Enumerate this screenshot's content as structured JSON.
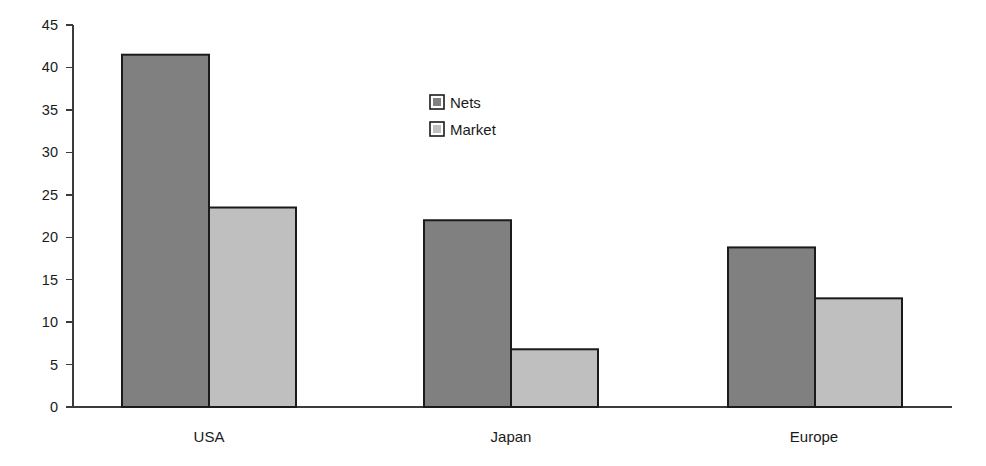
{
  "chart_data": {
    "type": "bar",
    "title": "",
    "subtitle": "",
    "xlabel": "",
    "ylabel": "",
    "categories": [
      "USA",
      "Japan",
      "Europe"
    ],
    "series": [
      {
        "name": "Nets",
        "color": "#808080",
        "values": [
          41.5,
          22.0,
          18.8
        ]
      },
      {
        "name": "Market",
        "color": "#bfbfbf",
        "values": [
          23.5,
          6.8,
          12.8
        ]
      }
    ],
    "ylim": [
      0,
      45
    ],
    "ytick_step": 5,
    "yticks": [
      "0",
      "5",
      "10",
      "15",
      "20",
      "25",
      "30",
      "35",
      "40",
      "45"
    ],
    "grid": false,
    "legend_position": "inside-upper-center",
    "axis_color": "#3b3b3b",
    "bar_border_color": "#1b1b1b",
    "background": "#ffffff"
  },
  "legend": {
    "entries": [
      {
        "label": "Nets",
        "swatch_color": "#808080"
      },
      {
        "label": "Market",
        "swatch_color": "#bfbfbf"
      }
    ]
  },
  "axes": {
    "y_tick_labels": [
      "45",
      "40",
      "35",
      "30",
      "25",
      "20",
      "15",
      "10",
      "5",
      "0"
    ],
    "x_tick_labels": [
      "USA",
      "Japan",
      "Europe"
    ]
  }
}
